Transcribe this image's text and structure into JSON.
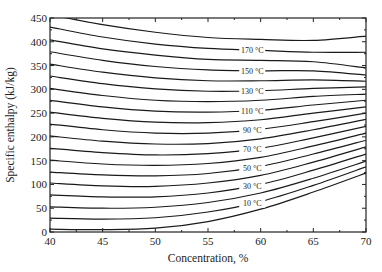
{
  "chart_data": {
    "type": "line",
    "title": "",
    "xlabel": "Concentration, %",
    "ylabel": "Specific enthalpy (kJ/kg)",
    "xlim": [
      40,
      70
    ],
    "ylim": [
      0,
      450
    ],
    "xticks": [
      40,
      45,
      50,
      55,
      60,
      65,
      70
    ],
    "yticks": [
      0,
      50,
      100,
      150,
      200,
      250,
      300,
      350,
      400,
      450
    ],
    "grid": false,
    "legend": "none (inline curve labels)",
    "x": [
      40,
      45,
      50,
      55,
      60,
      65,
      70
    ],
    "series": [
      {
        "name": "0 °C",
        "label": "",
        "values": [
          6,
          5,
          8,
          22,
          48,
          84,
          124
        ]
      },
      {
        "name": "10 °C",
        "label": "10 °C",
        "values": [
          29,
          27,
          30,
          42,
          64,
          98,
          137
        ]
      },
      {
        "name": "20 °C",
        "label": "",
        "values": [
          53,
          50,
          52,
          62,
          82,
          113,
          149
        ]
      },
      {
        "name": "30 °C",
        "label": "30 °C",
        "values": [
          78,
          74,
          74,
          82,
          100,
          130,
          164
        ]
      },
      {
        "name": "40 °C",
        "label": "",
        "values": [
          103,
          97,
          96,
          103,
          119,
          147,
          179
        ]
      },
      {
        "name": "50 °C",
        "label": "50 °C",
        "values": [
          126,
          120,
          118,
          123,
          138,
          164,
          193
        ]
      },
      {
        "name": "60 °C",
        "label": "",
        "values": [
          151,
          143,
          140,
          144,
          157,
          181,
          208
        ]
      },
      {
        "name": "70 °C",
        "label": "70 °C",
        "values": [
          176,
          167,
          162,
          165,
          176,
          198,
          222
        ]
      },
      {
        "name": "80 °C",
        "label": "",
        "values": [
          202,
          191,
          185,
          186,
          196,
          215,
          237
        ]
      },
      {
        "name": "90 °C",
        "label": "90 °C",
        "values": [
          227,
          215,
          208,
          208,
          216,
          232,
          250
        ]
      },
      {
        "name": "100 °C",
        "label": "",
        "values": [
          252,
          239,
          231,
          230,
          236,
          250,
          263
        ]
      },
      {
        "name": "110 °C",
        "label": "110 °C",
        "values": [
          277,
          263,
          254,
          252,
          256,
          267,
          277
        ]
      },
      {
        "name": "120 °C",
        "label": "",
        "values": [
          302,
          287,
          277,
          274,
          277,
          285,
          290
        ]
      },
      {
        "name": "130 °C",
        "label": "130 °C",
        "values": [
          328,
          312,
          301,
          296,
          297,
          302,
          305
        ]
      },
      {
        "name": "140 °C",
        "label": "",
        "values": [
          353,
          336,
          324,
          318,
          318,
          320,
          317
        ]
      },
      {
        "name": "150 °C",
        "label": "150 °C",
        "values": [
          379,
          361,
          348,
          341,
          339,
          339,
          330
        ]
      },
      {
        "name": "160 °C",
        "label": "",
        "values": [
          404,
          385,
          372,
          363,
          361,
          358,
          345
        ]
      },
      {
        "name": "170 °C",
        "label": "170 °C",
        "values": [
          431,
          410,
          395,
          386,
          382,
          378,
          378
        ]
      },
      {
        "name": "180 °C",
        "label": "",
        "values": [
          457,
          436,
          420,
          409,
          405,
          403,
          412
        ]
      }
    ],
    "label_x": 59.2
  }
}
